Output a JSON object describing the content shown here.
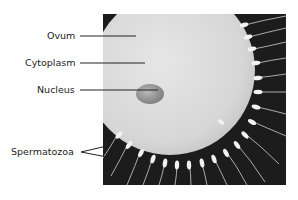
{
  "diagram": {
    "labels": [
      {
        "id": "ovum",
        "text": "Ovum"
      },
      {
        "id": "cytoplasm",
        "text": "Cytoplasm"
      },
      {
        "id": "nucleus",
        "text": "Nucleus"
      },
      {
        "id": "spermatozoa",
        "text": "Spermatozoa"
      }
    ],
    "colors": {
      "background": "#ffffff",
      "photo_background": "#1c1c1c",
      "ovum_fill": "#d9d9d9",
      "nucleus_fill": "#9a9a9a",
      "sperm_fill": "#f2f2f2",
      "label_text": "#222222"
    }
  }
}
